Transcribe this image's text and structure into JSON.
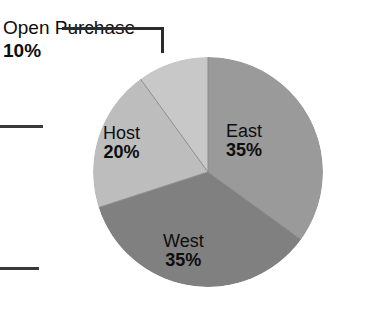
{
  "chart_data": {
    "type": "pie",
    "title": "",
    "xlabel": "",
    "ylabel": "",
    "legend": "none",
    "grid": false,
    "units": "percent",
    "start_angle_deg": 0,
    "direction": "clockwise",
    "categories": [
      "East",
      "West",
      "Host",
      "Open Purchase"
    ],
    "values": [
      35,
      35,
      20,
      10
    ],
    "slices": [
      {
        "name": "East",
        "value": 35,
        "value_label": "35%",
        "color": "#9a9a9a",
        "label_placement": "inside",
        "start_deg": 0,
        "end_deg": 126
      },
      {
        "name": "West",
        "value": 35,
        "value_label": "35%",
        "color": "#808080",
        "label_placement": "inside",
        "start_deg": 126,
        "end_deg": 252
      },
      {
        "name": "Host",
        "value": 20,
        "value_label": "20%",
        "color": "#bdbdbd",
        "label_placement": "inside",
        "start_deg": 252,
        "end_deg": 324
      },
      {
        "name": "Open Purchase",
        "value": 10,
        "value_label": "10%",
        "color": "#c8c8c8",
        "label_placement": "outside-callout",
        "start_deg": 324,
        "end_deg": 360
      }
    ]
  },
  "title": {
    "text": ""
  },
  "callout": {
    "name": "Open Purchase",
    "percent": "10%"
  },
  "labels": {
    "east": {
      "name": "East",
      "percent": "35%"
    },
    "west": {
      "name": "West",
      "percent": "35%"
    },
    "host": {
      "name": "Host",
      "percent": "20%"
    }
  },
  "colors": {
    "east": "#9a9a9a",
    "west": "#808080",
    "host": "#bdbdbd",
    "open_purchase": "#c8c8c8",
    "divider": "#8a8a8a",
    "text": "#0d0d0d",
    "leader_line": "#2b2b2b",
    "background": "#ffffff"
  }
}
